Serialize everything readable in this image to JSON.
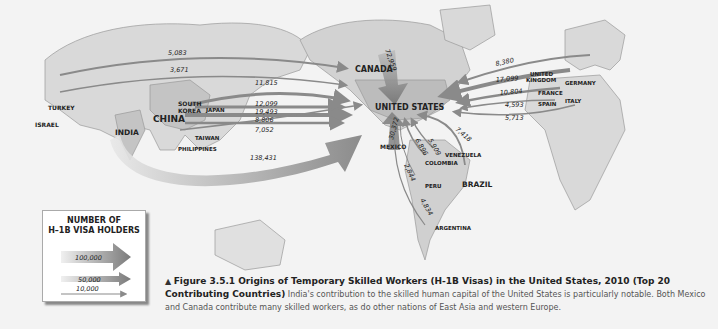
{
  "map": {
    "countries": {
      "turkey": "TURKEY",
      "israel": "ISRAEL",
      "india": "INDIA",
      "china": "CHINA",
      "south_korea_1": "SOUTH",
      "south_korea_2": "KOREA",
      "japan": "JAPAN",
      "taiwan": "TAIWAN",
      "philippines": "PHILIPPINES",
      "canada": "CANADA",
      "united_states": "UNITED STATES",
      "mexico": "MEXICO",
      "venezuela": "VENEZUELA",
      "colombia": "COLOMBIA",
      "peru": "PERU",
      "brazil": "BRAZIL",
      "argentina": "ARGENTINA",
      "uk_1": "UNITED",
      "uk_2": "KINGDOM",
      "germany": "GERMANY",
      "france": "FRANCE",
      "spain": "SPAIN",
      "italy": "ITALY"
    },
    "flows": [
      {
        "origin": "Turkey",
        "value": "5,083"
      },
      {
        "origin": "Israel",
        "value": "3,671"
      },
      {
        "origin": "South Korea",
        "value": "11,815"
      },
      {
        "origin": "Japan",
        "value": "12,099"
      },
      {
        "origin": "China",
        "value": "19,493"
      },
      {
        "origin": "Taiwan",
        "value": "8,806"
      },
      {
        "origin": "Philippines",
        "value": "7,052"
      },
      {
        "origin": "India",
        "value": "138,431"
      },
      {
        "origin": "Canada",
        "value": "72,959"
      },
      {
        "origin": "Mexico",
        "value": "30,372"
      },
      {
        "origin": "Venezuela",
        "value": "5,909"
      },
      {
        "origin": "Colombia",
        "value": "6,896"
      },
      {
        "origin": "Peru",
        "value": "2,844"
      },
      {
        "origin": "Argentina",
        "value": "4,834"
      },
      {
        "origin": "Brazil",
        "value": "7,418"
      },
      {
        "origin": "Germany",
        "value": "8,380"
      },
      {
        "origin": "United Kingdom",
        "value": "17,099"
      },
      {
        "origin": "France",
        "value": "10,804"
      },
      {
        "origin": "Spain",
        "value": "4,593"
      },
      {
        "origin": "Italy",
        "value": "5,713"
      }
    ]
  },
  "legend": {
    "title_1": "NUMBER OF",
    "title_2": "H–1B VISA HOLDERS",
    "items": [
      "100,000",
      "50,000",
      "10,000"
    ]
  },
  "caption": {
    "marker": "▲",
    "title": "Figure 3.5.1  Origins of Temporary Skilled Workers (H-1B Visas) in the United States, 2010 (Top 20 Contributing Countries)",
    "body": "India's contribution to the skilled human capital of the United States is particularly notable. Both Mexico and Canada contribute many skilled workers, as do other nations of East Asia and western Europe."
  },
  "colors": {
    "land": "#c9c9c9",
    "land_light": "#dcdcdc",
    "arrow": "#8a8a8a",
    "background": "#f3f3f3"
  }
}
